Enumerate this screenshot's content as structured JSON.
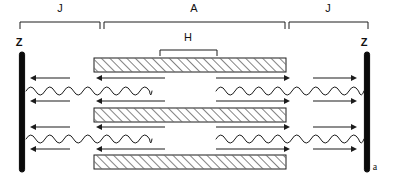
{
  "figure": {
    "caption_label": "a",
    "background_color": "#ffffff",
    "ink_color": "#1c1c1c",
    "width": 395,
    "height": 180
  },
  "top_brackets": [
    {
      "label": "J",
      "name": "bracket-j-left",
      "x1": 20,
      "x2": 100,
      "y": 22,
      "label_x": 60,
      "label_y": 12
    },
    {
      "label": "A",
      "name": "bracket-a-center",
      "x1": 104,
      "x2": 285,
      "y": 22,
      "label_x": 194,
      "label_y": 12
    },
    {
      "label": "J",
      "name": "bracket-j-right",
      "x1": 289,
      "x2": 368,
      "y": 22,
      "label_x": 328,
      "label_y": 12
    }
  ],
  "inner_bracket": {
    "label": "H",
    "name": "bracket-h",
    "x1": 160,
    "x2": 217,
    "y": 50,
    "label_x": 188,
    "label_y": 41
  },
  "walls": [
    {
      "label": "Z",
      "name": "wall-left",
      "x": 22,
      "y1": 52,
      "y2": 172,
      "label_x": 19,
      "label_y": 46
    },
    {
      "label": "Z",
      "name": "wall-right",
      "x": 367,
      "y1": 52,
      "y2": 172,
      "label_x": 364,
      "label_y": 46
    }
  ],
  "slabs": [
    {
      "name": "slab-top",
      "x": 94,
      "y": 58,
      "width": 192,
      "height": 14,
      "hatch": "forward"
    },
    {
      "name": "slab-middle",
      "x": 94,
      "y": 108,
      "width": 192,
      "height": 14,
      "hatch": "forward"
    },
    {
      "name": "slab-bottom",
      "x": 94,
      "y": 155,
      "width": 192,
      "height": 14,
      "hatch": "forward"
    }
  ],
  "wave_rows": [
    {
      "name": "wave-row-upper",
      "y": 91,
      "amplitude": 6,
      "period": 19,
      "segments": [
        {
          "x1": 26,
          "x2": 152,
          "name": "wave-left"
        },
        {
          "x1": 216,
          "x2": 364,
          "name": "wave-right"
        }
      ]
    },
    {
      "name": "wave-row-lower",
      "y": 139,
      "amplitude": 6,
      "period": 19,
      "segments": [
        {
          "x1": 26,
          "x2": 152,
          "name": "wave-left"
        },
        {
          "x1": 216,
          "x2": 364,
          "name": "wave-right"
        }
      ]
    }
  ],
  "arrow_rows": [
    {
      "name": "arrow-row-1",
      "y": 78,
      "arrows": [
        {
          "name": "arrow-left-short",
          "x1": 70,
          "x2": 30,
          "direction": "left"
        },
        {
          "name": "arrow-left-long",
          "x1": 165,
          "x2": 96,
          "direction": "left"
        },
        {
          "name": "arrow-right-long",
          "x1": 216,
          "x2": 290,
          "direction": "right"
        },
        {
          "name": "arrow-right-short",
          "x1": 313,
          "x2": 357,
          "direction": "right"
        }
      ]
    },
    {
      "name": "arrow-row-2",
      "y": 101,
      "arrows": [
        {
          "name": "arrow-left-short",
          "x1": 70,
          "x2": 30,
          "direction": "left"
        },
        {
          "name": "arrow-left-long",
          "x1": 165,
          "x2": 96,
          "direction": "left"
        },
        {
          "name": "arrow-right-long",
          "x1": 216,
          "x2": 290,
          "direction": "right"
        },
        {
          "name": "arrow-right-short",
          "x1": 313,
          "x2": 357,
          "direction": "right"
        }
      ]
    },
    {
      "name": "arrow-row-3",
      "y": 127,
      "arrows": [
        {
          "name": "arrow-left-short",
          "x1": 70,
          "x2": 30,
          "direction": "left"
        },
        {
          "name": "arrow-left-long",
          "x1": 165,
          "x2": 96,
          "direction": "left"
        },
        {
          "name": "arrow-right-long",
          "x1": 216,
          "x2": 290,
          "direction": "right"
        },
        {
          "name": "arrow-right-short",
          "x1": 313,
          "x2": 357,
          "direction": "right"
        }
      ]
    },
    {
      "name": "arrow-row-4",
      "y": 149,
      "arrows": [
        {
          "name": "arrow-left-short",
          "x1": 70,
          "x2": 30,
          "direction": "left"
        },
        {
          "name": "arrow-left-long",
          "x1": 165,
          "x2": 96,
          "direction": "left"
        },
        {
          "name": "arrow-right-long",
          "x1": 216,
          "x2": 290,
          "direction": "right"
        },
        {
          "name": "arrow-right-short",
          "x1": 313,
          "x2": 357,
          "direction": "right"
        }
      ]
    }
  ],
  "corner_label": {
    "text": "a",
    "x": 375,
    "y": 170,
    "name": "panel-label"
  }
}
